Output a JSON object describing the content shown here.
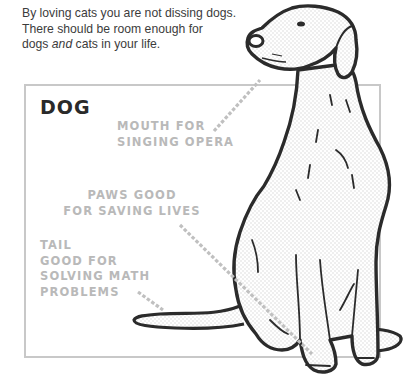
{
  "intro": {
    "line1": "By loving cats you are not dissing dogs.",
    "line2": "There should be room enough for",
    "line3_pre": "dogs ",
    "line3_em": "and",
    "line3_post": " cats in your life."
  },
  "panel": {
    "title": "DOG",
    "frame_color": "#c8c8c8",
    "label_color": "#b9b9b9"
  },
  "callouts": {
    "mouth": {
      "lines": [
        "MOUTH FOR",
        "SINGING OPERA"
      ]
    },
    "paws": {
      "lines": [
        "PAWS GOOD",
        "FOR SAVING LIVES"
      ]
    },
    "tail": {
      "lines": [
        "TAIL",
        "GOOD FOR",
        "SOLVING MATH",
        "PROBLEMS"
      ]
    }
  },
  "illustration": {
    "subject": "sitting-dog",
    "outline_color": "#2b2b2b"
  }
}
